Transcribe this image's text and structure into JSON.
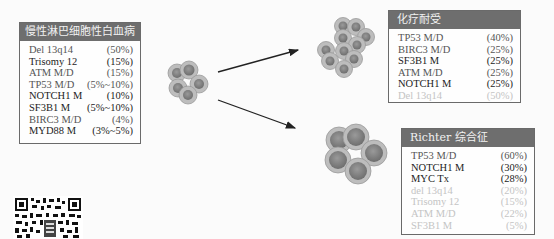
{
  "cll_panel": {
    "title": "慢性淋巴细胞性白血病",
    "rows": [
      {
        "gene": "Del 13q14",
        "value": "(50%)",
        "tone": "mid"
      },
      {
        "gene": "Trisomy 12",
        "value": "(15%)",
        "tone": "dark"
      },
      {
        "gene": "ATM M/D",
        "value": "(15%)",
        "tone": "mid"
      },
      {
        "gene": "TP53 M/D",
        "value": "(5%~10%)",
        "tone": "mid"
      },
      {
        "gene": "NOTCH1 M",
        "value": "(10%)",
        "tone": "dark"
      },
      {
        "gene": "SF3B1 M",
        "value": "(5%~10%)",
        "tone": "dark"
      },
      {
        "gene": "BIRC3 M/D",
        "value": "(4%)",
        "tone": "mid"
      },
      {
        "gene": "MYD88 M",
        "value": "(3%~5%)",
        "tone": "dark"
      }
    ]
  },
  "chemo_panel": {
    "title": "化疗耐受",
    "rows": [
      {
        "gene": "TP53 M/D",
        "value": "(40%)",
        "tone": "mid"
      },
      {
        "gene": "BIRC3 M/D",
        "value": "(25%)",
        "tone": "mid"
      },
      {
        "gene": "SF3B1 M",
        "value": "(25%)",
        "tone": "dark"
      },
      {
        "gene": "ATM M/D",
        "value": "(25%)",
        "tone": "mid"
      },
      {
        "gene": "NOTCH1 M",
        "value": "(25%)",
        "tone": "dark"
      },
      {
        "gene": "Del 13q14",
        "value": "(50%)",
        "tone": "faint"
      }
    ]
  },
  "richter_panel": {
    "title": "Richter 综合征",
    "rows": [
      {
        "gene": "TP53 M/D",
        "value": "(60%)",
        "tone": "mid"
      },
      {
        "gene": "NOTCH1 M",
        "value": "(30%)",
        "tone": "dark"
      },
      {
        "gene": "MYC Tx",
        "value": "(28%)",
        "tone": "dark"
      },
      {
        "gene": "del 13q14",
        "value": "(20%)",
        "tone": "faint"
      },
      {
        "gene": "Trisomy 12",
        "value": "(15%)",
        "tone": "faint"
      },
      {
        "gene": "ATM M/D",
        "value": "(22%)",
        "tone": "faint"
      },
      {
        "gene": "SF3B1 M",
        "value": "(5%)",
        "tone": "faint"
      }
    ]
  },
  "colors": {
    "header_bg": "#6e6e6e",
    "cell_outer": "#b9b9b9",
    "cell_nucleus": "#7c7c7c",
    "arrow": "#222222"
  }
}
